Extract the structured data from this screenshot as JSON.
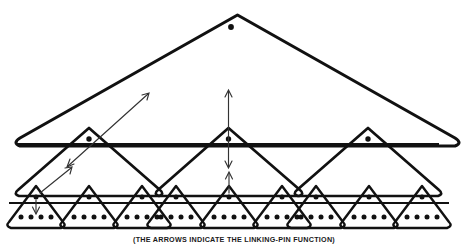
{
  "diagram": {
    "caption": "(THE ARROWS INDICATE THE LINKING-PIN FUNCTION)",
    "stroke_color": "#111111",
    "arrow_color": "#333333",
    "background_color": "#ffffff",
    "levels": [
      {
        "level": 1,
        "name": "top-level-triangle",
        "label": "Top management group",
        "count": 1,
        "dots_at_apex": 1,
        "dots_at_base": 0
      },
      {
        "level": 2,
        "name": "middle-level-triangles",
        "label": "Middle management groups",
        "count": 3,
        "dots_at_apex": 1,
        "dots_at_base": 0
      },
      {
        "level": 3,
        "name": "work-group-triangles",
        "label": "Work groups",
        "count": 9,
        "dots_at_apex": 1,
        "dots_at_base": 4
      }
    ],
    "arrows": [
      {
        "name": "arrow-diagonal-upper-left",
        "kind": "double-headed-diagonal",
        "description": "Links middle-level leader upward and downward along the left slope of the top triangle"
      },
      {
        "name": "arrow-diagonal-lower-left",
        "kind": "single-headed-diagonal",
        "description": "Links bottom work-group leader up to the middle-level group"
      },
      {
        "name": "arrow-vertical-center-upper",
        "kind": "double-headed-vertical",
        "description": "Links middle-level leader to the top management group"
      },
      {
        "name": "arrow-vertical-center-lower",
        "kind": "single-headed-vertical-up",
        "description": "Links work-group leader up to the middle-level group"
      },
      {
        "name": "arrow-vertical-left-down",
        "kind": "single-headed-vertical-down",
        "description": "Links work-group leader down to the work-group members"
      }
    ],
    "totals": {
      "total_triangles": 13,
      "total_dots": 49
    }
  }
}
